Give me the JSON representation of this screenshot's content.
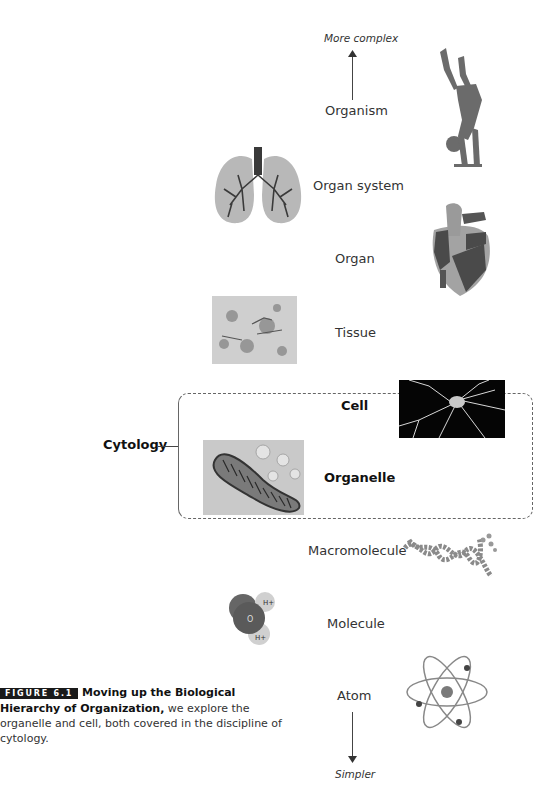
{
  "figure": {
    "top_label": "More complex",
    "bottom_label": "Simpler",
    "levels": [
      {
        "name": "Organism",
        "image": "handstand-person-icon"
      },
      {
        "name": "Organ system",
        "image": "lungs-icon"
      },
      {
        "name": "Organ",
        "image": "heart-icon"
      },
      {
        "name": "Tissue",
        "image": "tissue-micrograph"
      },
      {
        "name": "Cell",
        "image": "neuron-micrograph"
      },
      {
        "name": "Organelle",
        "image": "mitochondrion-micrograph"
      },
      {
        "name": "Macromolecule",
        "image": "dna-helix-icon"
      },
      {
        "name": "Molecule",
        "image": "water-molecule-icon"
      },
      {
        "name": "Atom",
        "image": "atom-icon"
      }
    ],
    "bracket_label": "Cytology",
    "molecule_labels": {
      "h1": "H+",
      "h2": "H+",
      "o": "O"
    }
  },
  "caption": {
    "tag": "FIGURE 6.1",
    "title": "Moving up the Biological Hierarchy of Organization,",
    "body": " we explore the organelle and cell, both covered in the discipline of cytology."
  }
}
